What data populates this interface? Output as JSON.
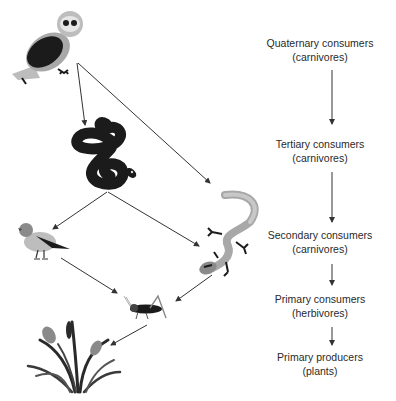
{
  "diagram": {
    "type": "food-chain",
    "colors": {
      "ink": "#2a2a2a",
      "arrow": "#333333",
      "dark": "#1b1b1b",
      "mid": "#8a8a8a",
      "light": "#bdbdbd"
    },
    "organisms": [
      {
        "id": "owl",
        "name": "Owl",
        "icon": "owl-icon"
      },
      {
        "id": "snake",
        "name": "Snake",
        "icon": "snake-icon"
      },
      {
        "id": "bird",
        "name": "Bird",
        "icon": "bird-icon"
      },
      {
        "id": "lizard",
        "name": "Lizard",
        "icon": "lizard-icon"
      },
      {
        "id": "grasshopper",
        "name": "Grasshopper",
        "icon": "grasshopper-icon"
      },
      {
        "id": "plants",
        "name": "Plants",
        "icon": "plants-icon"
      }
    ],
    "links": [
      {
        "from": "owl",
        "to": "snake"
      },
      {
        "from": "owl",
        "to": "lizard"
      },
      {
        "from": "snake",
        "to": "bird"
      },
      {
        "from": "snake",
        "to": "lizard"
      },
      {
        "from": "bird",
        "to": "grasshopper"
      },
      {
        "from": "lizard",
        "to": "grasshopper"
      },
      {
        "from": "grasshopper",
        "to": "plants"
      }
    ]
  },
  "levels": [
    {
      "title": "Quaternary consumers",
      "subtitle": "(carnivores)"
    },
    {
      "title": "Tertiary consumers",
      "subtitle": "(carnivores)"
    },
    {
      "title": "Secondary consumers",
      "subtitle": "(carnivores)"
    },
    {
      "title": "Primary consumers",
      "subtitle": "(herbivores)"
    },
    {
      "title": "Primary producers",
      "subtitle": "(plants)"
    }
  ]
}
